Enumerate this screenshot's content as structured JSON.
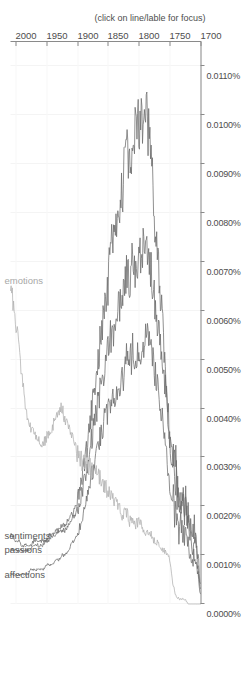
{
  "chart_data": {
    "type": "line",
    "title": "",
    "subtitle": "",
    "xlabel": "(click on line/lable for focus)",
    "ylabel": "",
    "xlim": [
      1700,
      2008
    ],
    "ylim": [
      0.0,
      0.0115
    ],
    "grid": true,
    "legend_position": "line-end-labels",
    "x_ticks": [
      "1700",
      "1750",
      "1800",
      "1850",
      "1900",
      "1950",
      "2000"
    ],
    "x_tick_values": [
      1700,
      1750,
      1800,
      1850,
      1900,
      1950,
      2000
    ],
    "y_ticks": [
      "0.0000%",
      "0.0010%",
      "0.0020%",
      "0.0030%",
      "0.0040%",
      "0.0050%",
      "0.0060%",
      "0.0070%",
      "0.0080%",
      "0.0090%",
      "0.0100%",
      "0.0110%"
    ],
    "y_tick_values": [
      0.0,
      0.001,
      0.002,
      0.003,
      0.004,
      0.005,
      0.006,
      0.007,
      0.008,
      0.009,
      0.01,
      0.011
    ],
    "x": [
      1700,
      1705,
      1710,
      1715,
      1720,
      1725,
      1730,
      1735,
      1740,
      1745,
      1750,
      1755,
      1760,
      1765,
      1770,
      1775,
      1780,
      1785,
      1790,
      1795,
      1800,
      1805,
      1810,
      1815,
      1820,
      1825,
      1830,
      1835,
      1840,
      1845,
      1850,
      1855,
      1860,
      1865,
      1870,
      1875,
      1880,
      1885,
      1890,
      1895,
      1900,
      1905,
      1910,
      1915,
      1920,
      1925,
      1930,
      1935,
      1940,
      1945,
      1950,
      1955,
      1960,
      1965,
      1970,
      1975,
      1980,
      1985,
      1990,
      1995,
      2000,
      2005,
      2008
    ],
    "series": [
      {
        "name": "sentiments",
        "color": "#6b6b6b",
        "label_color": "#5a5a5a",
        "values": [
          0.0003,
          0.0009,
          0.0013,
          0.0012,
          0.0016,
          0.0019,
          0.0022,
          0.0021,
          0.0025,
          0.0029,
          0.0033,
          0.0046,
          0.0055,
          0.0064,
          0.0073,
          0.0081,
          0.0089,
          0.0098,
          0.0102,
          0.0097,
          0.0101,
          0.0094,
          0.0098,
          0.009,
          0.0092,
          0.0086,
          0.0083,
          0.0078,
          0.0074,
          0.0072,
          0.0066,
          0.0061,
          0.0056,
          0.0051,
          0.0046,
          0.0041,
          0.0036,
          0.0031,
          0.0027,
          0.0024,
          0.0021,
          0.0019,
          0.0018,
          0.0017,
          0.0016,
          0.0016,
          0.0015,
          0.0015,
          0.0014,
          0.0014,
          0.0013,
          0.0013,
          0.0013,
          0.0013,
          0.0013,
          0.0012,
          0.0012,
          0.0012,
          0.0012,
          0.0013,
          0.0013,
          0.0014,
          0.0014
        ]
      },
      {
        "name": "passions",
        "color": "#6b6b6b",
        "label_color": "#5a5a5a",
        "values": [
          0.0004,
          0.0011,
          0.0016,
          0.0015,
          0.0019,
          0.0021,
          0.0024,
          0.0023,
          0.0027,
          0.003,
          0.0034,
          0.0042,
          0.0048,
          0.0053,
          0.0059,
          0.0063,
          0.0068,
          0.0072,
          0.0074,
          0.007,
          0.0072,
          0.0068,
          0.0071,
          0.0066,
          0.0068,
          0.0064,
          0.0062,
          0.0059,
          0.0057,
          0.0055,
          0.0052,
          0.0049,
          0.0045,
          0.0042,
          0.0038,
          0.0035,
          0.0031,
          0.0027,
          0.0024,
          0.0021,
          0.0019,
          0.0018,
          0.0017,
          0.0016,
          0.0015,
          0.0015,
          0.0015,
          0.0014,
          0.0014,
          0.0013,
          0.0013,
          0.0012,
          0.0012,
          0.0012,
          0.0012,
          0.0011,
          0.0011,
          0.0011,
          0.0011,
          0.0011,
          0.0011,
          0.0011,
          0.0011
        ]
      },
      {
        "name": "affections",
        "color": "#6b6b6b",
        "label_color": "#5a5a5a",
        "values": [
          0.0002,
          0.0007,
          0.001,
          0.0009,
          0.0012,
          0.0014,
          0.0016,
          0.0015,
          0.0018,
          0.0021,
          0.0024,
          0.0031,
          0.0036,
          0.004,
          0.0045,
          0.0048,
          0.0051,
          0.0054,
          0.0055,
          0.0052,
          0.0054,
          0.005,
          0.0052,
          0.0048,
          0.005,
          0.0047,
          0.0046,
          0.0044,
          0.0043,
          0.0042,
          0.004,
          0.0038,
          0.0035,
          0.0033,
          0.003,
          0.0027,
          0.0024,
          0.0021,
          0.0018,
          0.0016,
          0.0014,
          0.0013,
          0.0012,
          0.0011,
          0.001,
          0.001,
          0.0009,
          0.0009,
          0.0008,
          0.0008,
          0.0008,
          0.0007,
          0.0007,
          0.0007,
          0.0007,
          0.0007,
          0.0006,
          0.0006,
          0.0006,
          0.0006,
          0.0006,
          0.0006,
          0.0006
        ]
      },
      {
        "name": "emotions",
        "color": "#b0b0b0",
        "label_color": "#a8a8a8",
        "values": [
          0.0,
          0.0,
          0.0,
          0.0,
          0.0,
          0.0001,
          0.0001,
          0.0001,
          0.0002,
          0.0004,
          0.0009,
          0.001,
          0.0011,
          0.0012,
          0.0013,
          0.0013,
          0.0014,
          0.0015,
          0.0015,
          0.0016,
          0.0017,
          0.0016,
          0.0018,
          0.0017,
          0.0019,
          0.0018,
          0.0019,
          0.002,
          0.0021,
          0.0022,
          0.0023,
          0.0024,
          0.0025,
          0.0026,
          0.0027,
          0.0027,
          0.0028,
          0.0028,
          0.0029,
          0.003,
          0.0031,
          0.0033,
          0.0035,
          0.0036,
          0.0038,
          0.004,
          0.0039,
          0.0038,
          0.0036,
          0.0035,
          0.0034,
          0.0033,
          0.0033,
          0.0034,
          0.0035,
          0.0036,
          0.0038,
          0.0042,
          0.0047,
          0.0053,
          0.0058,
          0.0063,
          0.0066
        ]
      }
    ]
  }
}
